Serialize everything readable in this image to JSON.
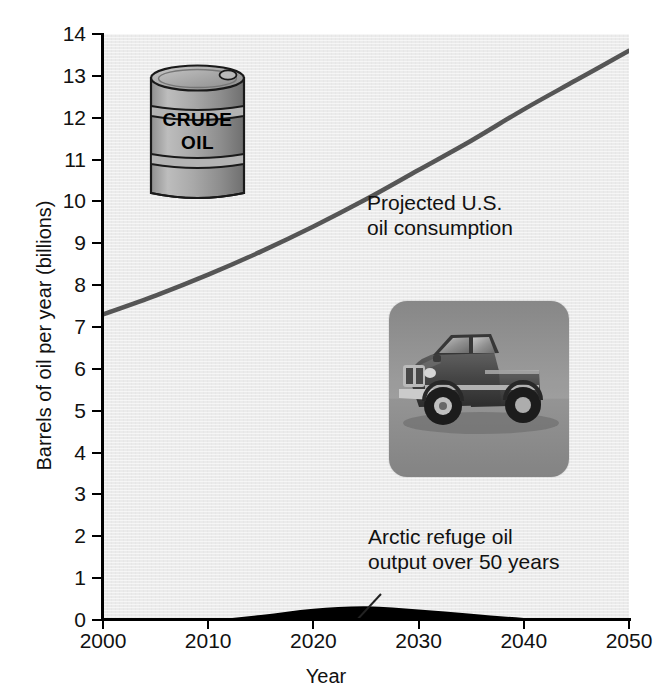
{
  "chart_data": {
    "type": "area",
    "title": "",
    "xlabel": "Year",
    "ylabel": "Barrels of oil per year (billions)",
    "xlim": [
      2000,
      2050
    ],
    "ylim": [
      0,
      14
    ],
    "grid": false,
    "legend_position": "inline-annotations",
    "xticks": [
      "2000",
      "2010",
      "2020",
      "2030",
      "2040",
      "2050"
    ],
    "xtick_values": [
      2000,
      2010,
      2020,
      2030,
      2040,
      2050
    ],
    "yticks": [
      "0",
      "1",
      "2",
      "3",
      "4",
      "5",
      "6",
      "7",
      "8",
      "9",
      "10",
      "11",
      "12",
      "13",
      "14"
    ],
    "ytick_values": [
      0,
      1,
      2,
      3,
      4,
      5,
      6,
      7,
      8,
      9,
      10,
      11,
      12,
      13,
      14
    ],
    "x": [
      2000,
      2005,
      2010,
      2015,
      2020,
      2025,
      2030,
      2035,
      2040,
      2045,
      2050
    ],
    "series": [
      {
        "name": "Projected U.S. oil consumption",
        "type": "line",
        "color": "#555555",
        "values": [
          7.3,
          7.75,
          8.25,
          8.8,
          9.4,
          10.05,
          10.75,
          11.45,
          12.2,
          12.9,
          13.6
        ]
      },
      {
        "name": "Arctic refuge oil output over 50 years",
        "type": "area",
        "color": "#000000",
        "values": [
          0.0,
          0.0,
          0.01,
          0.12,
          0.27,
          0.33,
          0.25,
          0.15,
          0.05,
          0.01,
          0.0
        ]
      }
    ],
    "annotations": [
      {
        "id": "consumption",
        "text_line1": "Projected U.S.",
        "text_line2": "oil consumption",
        "points_to_series": "Projected U.S. oil consumption"
      },
      {
        "id": "arctic",
        "text_line1": "Arctic refuge oil",
        "text_line2": "output over 50 years",
        "points_to_series": "Arctic refuge oil output over 50 years"
      }
    ]
  },
  "axes": {
    "x_title": "Year",
    "y_title": "Barrels of oil per year (billions)"
  },
  "illustrations": {
    "barrel": {
      "name": "crude-oil-barrel",
      "label_line1": "CRUDE",
      "label_line2": "OIL",
      "body_color": "#a8a8a8",
      "outline_color": "#1a1a1a"
    },
    "truck": {
      "name": "pickup-truck-photo",
      "alt": "Gray pickup truck photograph",
      "background_color": "#9e9e9e"
    }
  },
  "colors": {
    "plot_background": "#ebebeb",
    "page_background": "#ffffff",
    "consumption_line": "#555555",
    "arctic_area": "#000000",
    "axis": "#000000",
    "text": "#111111"
  }
}
